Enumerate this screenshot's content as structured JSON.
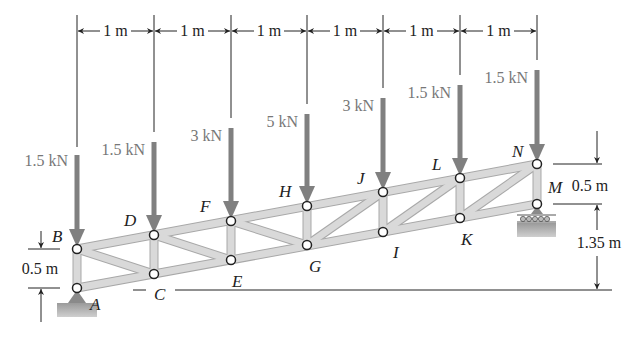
{
  "colors": {
    "member": "#d6d6d6",
    "member_edge": "#a8a8a8",
    "load_arrow": "#808080",
    "line": "#222222",
    "node_fill": "#ffffff",
    "support": "#8a8a8a"
  },
  "dimensions": {
    "panel_spacing": [
      "1 m",
      "1 m",
      "1 m",
      "1 m",
      "1 m",
      "1 m",
      "1 m"
    ],
    "left_height": "0.5 m",
    "right_height": "0.5 m",
    "right_elevation": "1.35 m"
  },
  "nodes": {
    "A": "A",
    "B": "B",
    "C": "C",
    "D": "D",
    "E": "E",
    "F": "F",
    "G": "G",
    "H": "H",
    "I": "I",
    "J": "J",
    "K": "K",
    "L": "L",
    "M": "M",
    "N": "N"
  },
  "loads": [
    {
      "node": "B",
      "label": "1.5 kN"
    },
    {
      "node": "D",
      "label": "1.5 kN"
    },
    {
      "node": "F",
      "label": "3 kN"
    },
    {
      "node": "H",
      "label": "5 kN"
    },
    {
      "node": "J",
      "label": "3 kN"
    },
    {
      "node": "L",
      "label": "1.5 kN"
    },
    {
      "node": "N",
      "label": "1.5 kN"
    }
  ],
  "supports": {
    "A": "pin",
    "M": "roller"
  }
}
